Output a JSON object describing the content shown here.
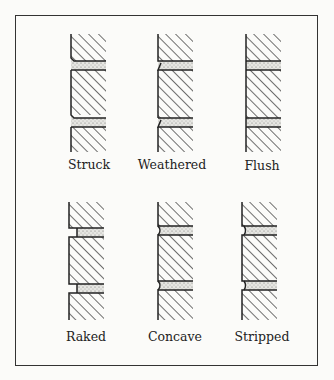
{
  "figure": {
    "items": [
      {
        "id": "struck",
        "label": "Struck"
      },
      {
        "id": "weathered",
        "label": "Weathered"
      },
      {
        "id": "flush",
        "label": "Flush"
      },
      {
        "id": "raked",
        "label": "Raked"
      },
      {
        "id": "concave",
        "label": "Concave"
      },
      {
        "id": "stripped",
        "label": "Stripped"
      }
    ]
  }
}
